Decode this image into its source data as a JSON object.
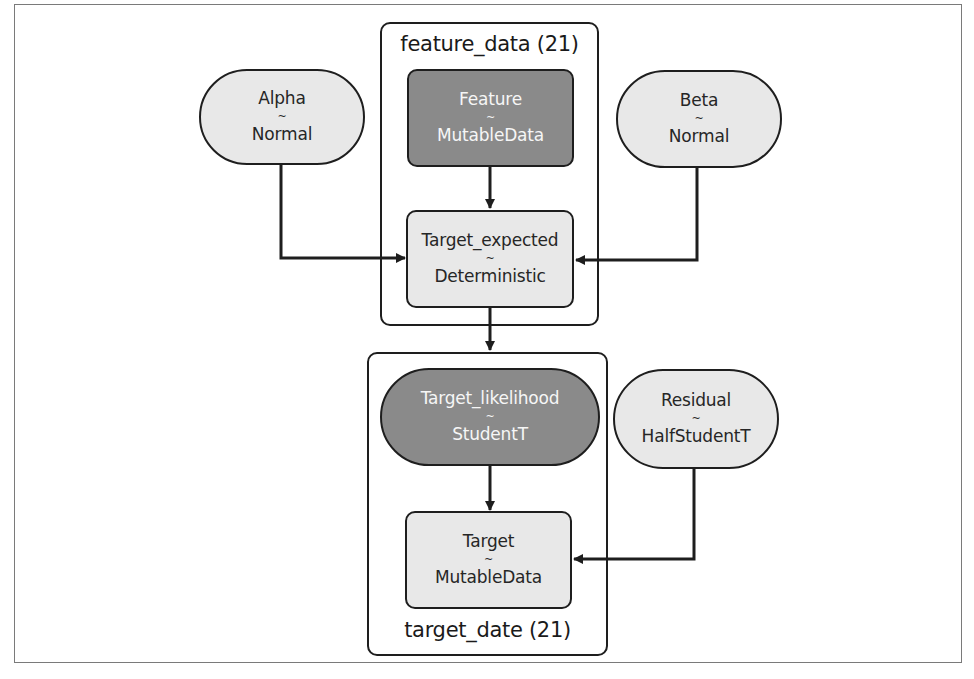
{
  "diagram": {
    "type": "probabilistic-graphical-model",
    "plates": [
      {
        "id": "feature_data",
        "label": "feature_data (21)"
      },
      {
        "id": "target_date",
        "label": "target_date (21)"
      }
    ],
    "nodes": {
      "alpha": {
        "name": "Alpha",
        "tilde": "~",
        "dist": "Normal",
        "shape": "ellipse",
        "style": "light"
      },
      "beta": {
        "name": "Beta",
        "tilde": "~",
        "dist": "Normal",
        "shape": "ellipse",
        "style": "light"
      },
      "feature": {
        "name": "Feature",
        "tilde": "~",
        "dist": "MutableData",
        "shape": "rect",
        "style": "dark",
        "plate": "feature_data"
      },
      "target_expected": {
        "name": "Target_expected",
        "tilde": "~",
        "dist": "Deterministic",
        "shape": "rect",
        "style": "light",
        "plate": "feature_data"
      },
      "target_likelihood": {
        "name": "Target_likelihood",
        "tilde": "~",
        "dist": "StudentT",
        "shape": "ellipse",
        "style": "dark",
        "plate": "target_date"
      },
      "residual": {
        "name": "Residual",
        "tilde": "~",
        "dist": "HalfStudentT",
        "shape": "ellipse",
        "style": "light"
      },
      "target": {
        "name": "Target",
        "tilde": "~",
        "dist": "MutableData",
        "shape": "rect",
        "style": "light",
        "plate": "target_date"
      }
    },
    "edges": [
      {
        "from": "Feature",
        "to": "Target_expected"
      },
      {
        "from": "Alpha",
        "to": "Target_expected"
      },
      {
        "from": "Beta",
        "to": "Target_expected"
      },
      {
        "from": "Target_expected",
        "to": "Target_likelihood"
      },
      {
        "from": "Target_likelihood",
        "to": "Target"
      },
      {
        "from": "Residual",
        "to": "Target"
      }
    ],
    "colors": {
      "stroke": "#1e1e1e",
      "light_fill": "#e8e8e8",
      "dark_fill": "#8a8a8a",
      "frame": "#7a7a7a"
    }
  }
}
